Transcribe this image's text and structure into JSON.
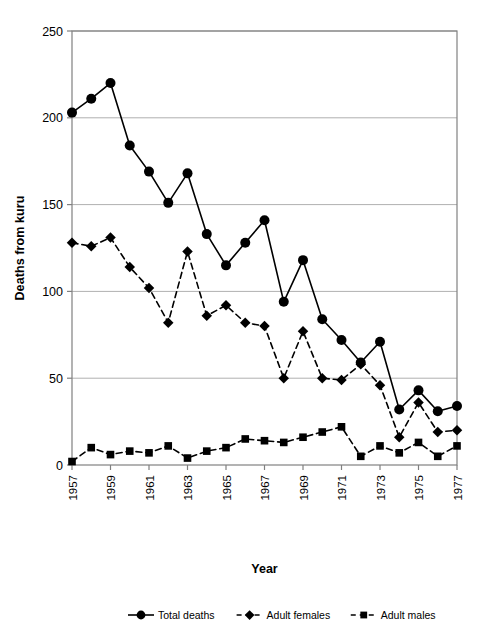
{
  "chart_data": {
    "type": "line",
    "title": "",
    "xlabel": "Year",
    "ylabel": "Deaths from kuru",
    "xlim": [
      1957,
      1977
    ],
    "ylim": [
      0,
      250
    ],
    "yticks": [
      0,
      50,
      100,
      150,
      200,
      250
    ],
    "xticks": [
      1957,
      1959,
      1961,
      1963,
      1965,
      1967,
      1969,
      1971,
      1973,
      1975,
      1977
    ],
    "x": [
      1957,
      1958,
      1959,
      1960,
      1961,
      1962,
      1963,
      1964,
      1965,
      1966,
      1967,
      1968,
      1969,
      1970,
      1971,
      1972,
      1973,
      1974,
      1975,
      1976,
      1977
    ],
    "grid": true,
    "legend_position": "bottom",
    "series": [
      {
        "name": "Total deaths",
        "marker": "circle",
        "linestyle": "solid",
        "color": "#000000",
        "values": [
          203,
          211,
          220,
          184,
          169,
          151,
          168,
          133,
          115,
          128,
          141,
          94,
          118,
          84,
          72,
          59,
          71,
          32,
          43,
          31,
          34
        ]
      },
      {
        "name": "Adult females",
        "marker": "diamond",
        "linestyle": "dashed",
        "color": "#000000",
        "values": [
          128,
          126,
          131,
          114,
          102,
          82,
          123,
          86,
          92,
          82,
          80,
          50,
          77,
          50,
          49,
          58,
          46,
          16,
          36,
          19,
          20
        ]
      },
      {
        "name": "Adult males",
        "marker": "square",
        "linestyle": "dashed",
        "color": "#000000",
        "values": [
          2,
          10,
          6,
          8,
          7,
          11,
          4,
          8,
          10,
          15,
          14,
          13,
          16,
          19,
          22,
          5,
          11,
          7,
          13,
          5,
          11
        ]
      }
    ]
  },
  "axes": {
    "y_label": "Deaths from kuru",
    "x_label": "Year",
    "y_tick_labels": [
      "0",
      "50",
      "100",
      "150",
      "200",
      "250"
    ],
    "x_tick_labels": [
      "1957",
      "1959",
      "1961",
      "1963",
      "1965",
      "1967",
      "1969",
      "1971",
      "1973",
      "1975",
      "1977"
    ]
  },
  "legend": {
    "items": [
      {
        "label": "Total deaths",
        "marker": "circle-marker",
        "line": "solid"
      },
      {
        "label": "Adult females",
        "marker": "diamond-marker",
        "line": "dashed"
      },
      {
        "label": "Adult males",
        "marker": "square-marker",
        "line": "dashed"
      }
    ]
  },
  "style": {
    "axis_color": "#808080",
    "grid_color": "#b0b0b0",
    "series_color": "#000000",
    "background": "#ffffff"
  }
}
